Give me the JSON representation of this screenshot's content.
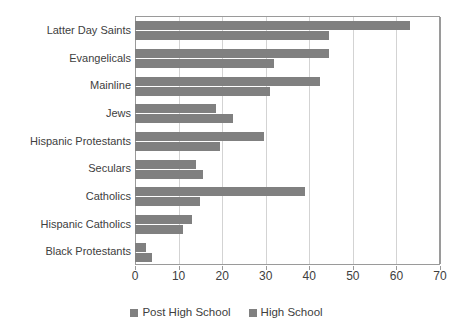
{
  "chart_data": {
    "type": "bar",
    "orientation": "horizontal",
    "title": "",
    "subtitle": "",
    "xlabel": "",
    "ylabel": "",
    "xlim": [
      0,
      70
    ],
    "xticks": [
      0,
      10,
      20,
      30,
      40,
      50,
      60,
      70
    ],
    "xtick_labels": [
      "0",
      "10",
      "20",
      "30",
      "40",
      "50",
      "60",
      "70"
    ],
    "grid": true,
    "grid_axis": "x",
    "legend_position": "bottom",
    "categories": [
      "Latter Day Saints",
      "Evangelicals",
      "Mainline",
      "Jews",
      "Hispanic Protestants",
      "Seculars",
      "Catholics",
      "Hispanic Catholics",
      "Black Protestants"
    ],
    "series": [
      {
        "name": "Post High School",
        "color": "#808080",
        "values": [
          63,
          44.5,
          42.5,
          18.5,
          29.5,
          14,
          39,
          13,
          2.5
        ]
      },
      {
        "name": "High School",
        "color": "#808080",
        "values": [
          44.5,
          32,
          31,
          22.5,
          19.5,
          15.5,
          15,
          11,
          4
        ]
      }
    ]
  },
  "legend": {
    "entries": [
      {
        "label": "Post High School",
        "swatch_name": "legend-swatch-post-high-school"
      },
      {
        "label": "High School",
        "swatch_name": "legend-swatch-high-school"
      }
    ]
  },
  "colors": {
    "bar_fill": "#808080",
    "gridline": "#d3d3d3",
    "axis": "#9a9a9a",
    "text": "#404040",
    "background": "#ffffff"
  }
}
